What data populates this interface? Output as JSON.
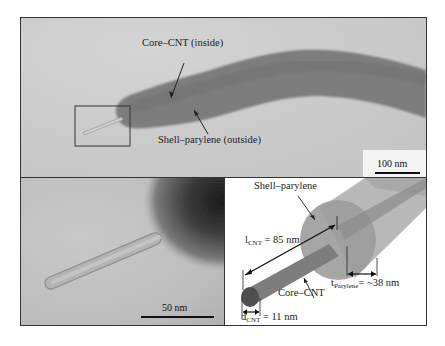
{
  "figure": {
    "top_panel": {
      "type": "TEM micrograph",
      "labels": {
        "core": "Core–CNT (inside)",
        "shell": "Shell–parylene (outside)"
      },
      "scale_bar": "100 nm"
    },
    "bottom_left_panel": {
      "type": "TEM micrograph (zoom of boxed region)",
      "scale_bar": "50 nm"
    },
    "bottom_right_panel": {
      "type": "3D schematic",
      "labels": {
        "shell": "Shell–parylene",
        "core": "Core–CNT",
        "l_cnt_main": "l",
        "l_cnt_sub": "CNT",
        "l_cnt_value": " = 85 nm",
        "t_parylene_main": "t",
        "t_parylene_sub": "Parylene",
        "t_parylene_value": "= ~38 nm",
        "d_cnt_main": "d",
        "d_cnt_sub": "CNT",
        "d_cnt_value": " = 11 nm"
      }
    },
    "colors": {
      "tem_background": "#cbcbcb",
      "shell_dark": "#7a7a7a",
      "schematic_shell": "#9a9a9a",
      "schematic_core": "#6f6f6f",
      "schematic_core_end": "#4a4a4a",
      "line": "#222222"
    }
  }
}
